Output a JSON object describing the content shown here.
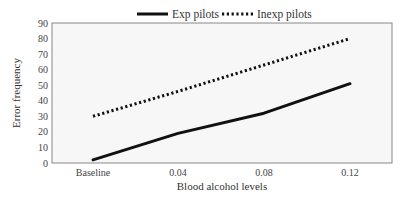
{
  "chart_data": {
    "type": "line",
    "title": "",
    "xlabel": "Blood alcohol levels",
    "ylabel": "Error frequency",
    "categories": [
      "Baseline",
      "0.04",
      "0.08",
      "0.12"
    ],
    "series": [
      {
        "name": "Exp pilots",
        "style": "solid",
        "color": "#111111",
        "values": [
          2,
          19,
          32,
          51
        ]
      },
      {
        "name": "Inexp pilots",
        "style": "dotted",
        "color": "#111111",
        "values": [
          30,
          46,
          63,
          80
        ]
      }
    ],
    "yticks": [
      0,
      10,
      20,
      30,
      40,
      50,
      60,
      70,
      80,
      90
    ],
    "ylim": [
      0,
      90
    ],
    "grid": false,
    "legend_position": "top"
  },
  "legend": {
    "items": [
      {
        "label": "Exp pilots",
        "style": "solid"
      },
      {
        "label": "Inexp pilots",
        "style": "dotted"
      }
    ]
  },
  "colors": {
    "line": "#111111",
    "plot_background": "#f7f7f7",
    "axis": "#777777"
  }
}
